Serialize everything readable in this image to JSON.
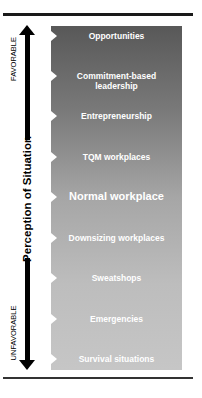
{
  "diagram": {
    "axis": {
      "label": "Perception of Situation",
      "top_label": "FAVORABLE",
      "bottom_label": "UNFAVORABLE",
      "direction": "bidirectional-vertical-arrow"
    },
    "colors": {
      "panel_top": "#585858",
      "panel_bottom": "#c6c6c6",
      "item_text": "#ffffff",
      "arrow": "#000000"
    },
    "items": [
      {
        "label": "Opportunities"
      },
      {
        "label": "Commitment-based",
        "label2": "leadership"
      },
      {
        "label": "Entrepreneurship"
      },
      {
        "label": "TQM workplaces"
      },
      {
        "label": "Normal workplace"
      },
      {
        "label": "Downsizing workplaces"
      },
      {
        "label": "Sweatshops"
      },
      {
        "label": "Emergencies"
      },
      {
        "label": "Survival situations"
      }
    ]
  }
}
